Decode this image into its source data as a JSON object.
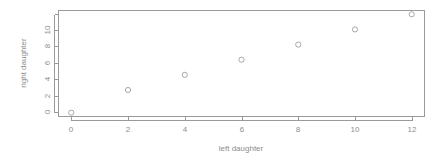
{
  "chart_data": {
    "type": "scatter",
    "title": "",
    "xlabel": "left daughter",
    "ylabel": "right daughter",
    "x": [
      0,
      2,
      4,
      6,
      8,
      10,
      12
    ],
    "values": [
      0,
      3,
      5,
      7,
      9,
      11,
      13
    ],
    "points": [
      {
        "x": 0,
        "y": 0
      },
      {
        "x": 2,
        "y": 3
      },
      {
        "x": 4,
        "y": 5
      },
      {
        "x": 6,
        "y": 7
      },
      {
        "x": 8,
        "y": 9
      },
      {
        "x": 10,
        "y": 11
      },
      {
        "x": 12,
        "y": 13
      }
    ],
    "xticks": [
      0,
      2,
      4,
      6,
      8,
      10,
      12
    ],
    "xtick_labels": [
      "0",
      "2",
      "4",
      "6",
      "8",
      "10",
      "12"
    ],
    "yticks": [
      0,
      2,
      4,
      6,
      8,
      10,
      12
    ],
    "ytick_labels": [
      "0",
      "2",
      "4",
      "6",
      "8",
      "10",
      ""
    ],
    "xlim": [
      -0.45,
      12.45
    ],
    "ylim": [
      -0.5,
      13.5
    ],
    "grid": false,
    "legend": null,
    "marker": "open-circle",
    "marker_color": "#a8a8a8",
    "axis_color": "#9a9a9a",
    "text_color": "#8d8d8d",
    "background": "#ffffff"
  },
  "axes": {
    "x_title": "left daughter",
    "y_title": "right daughter"
  }
}
